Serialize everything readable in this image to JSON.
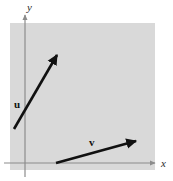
{
  "figure": {
    "background_color": "#ffffff",
    "plot_region": {
      "fill_color": "#d9d9d9",
      "x": 10,
      "y": 23,
      "width": 145,
      "height": 147
    },
    "axes": {
      "color": "#8c8c8c",
      "stroke_width": 1.2,
      "x_axis": {
        "label": "x",
        "y_position": 163,
        "x_start": 4,
        "x_end": 156,
        "label_x": 161,
        "label_y": 167
      },
      "y_axis": {
        "label": "y",
        "x_position": 25,
        "y_start": 14,
        "y_end": 177,
        "label_x": 27,
        "label_y": 11
      }
    },
    "vectors": [
      {
        "name": "u",
        "label": "u",
        "color": "#111111",
        "stroke_width": 2.6,
        "tail_x": 14,
        "tail_y": 129,
        "head_x": 58,
        "head_y": 54,
        "label_x": 14,
        "label_y": 108
      },
      {
        "name": "v",
        "label": "v",
        "color": "#111111",
        "stroke_width": 2.6,
        "tail_x": 56,
        "tail_y": 163,
        "head_x": 138,
        "head_y": 140,
        "label_x": 89,
        "label_y": 146
      }
    ]
  }
}
